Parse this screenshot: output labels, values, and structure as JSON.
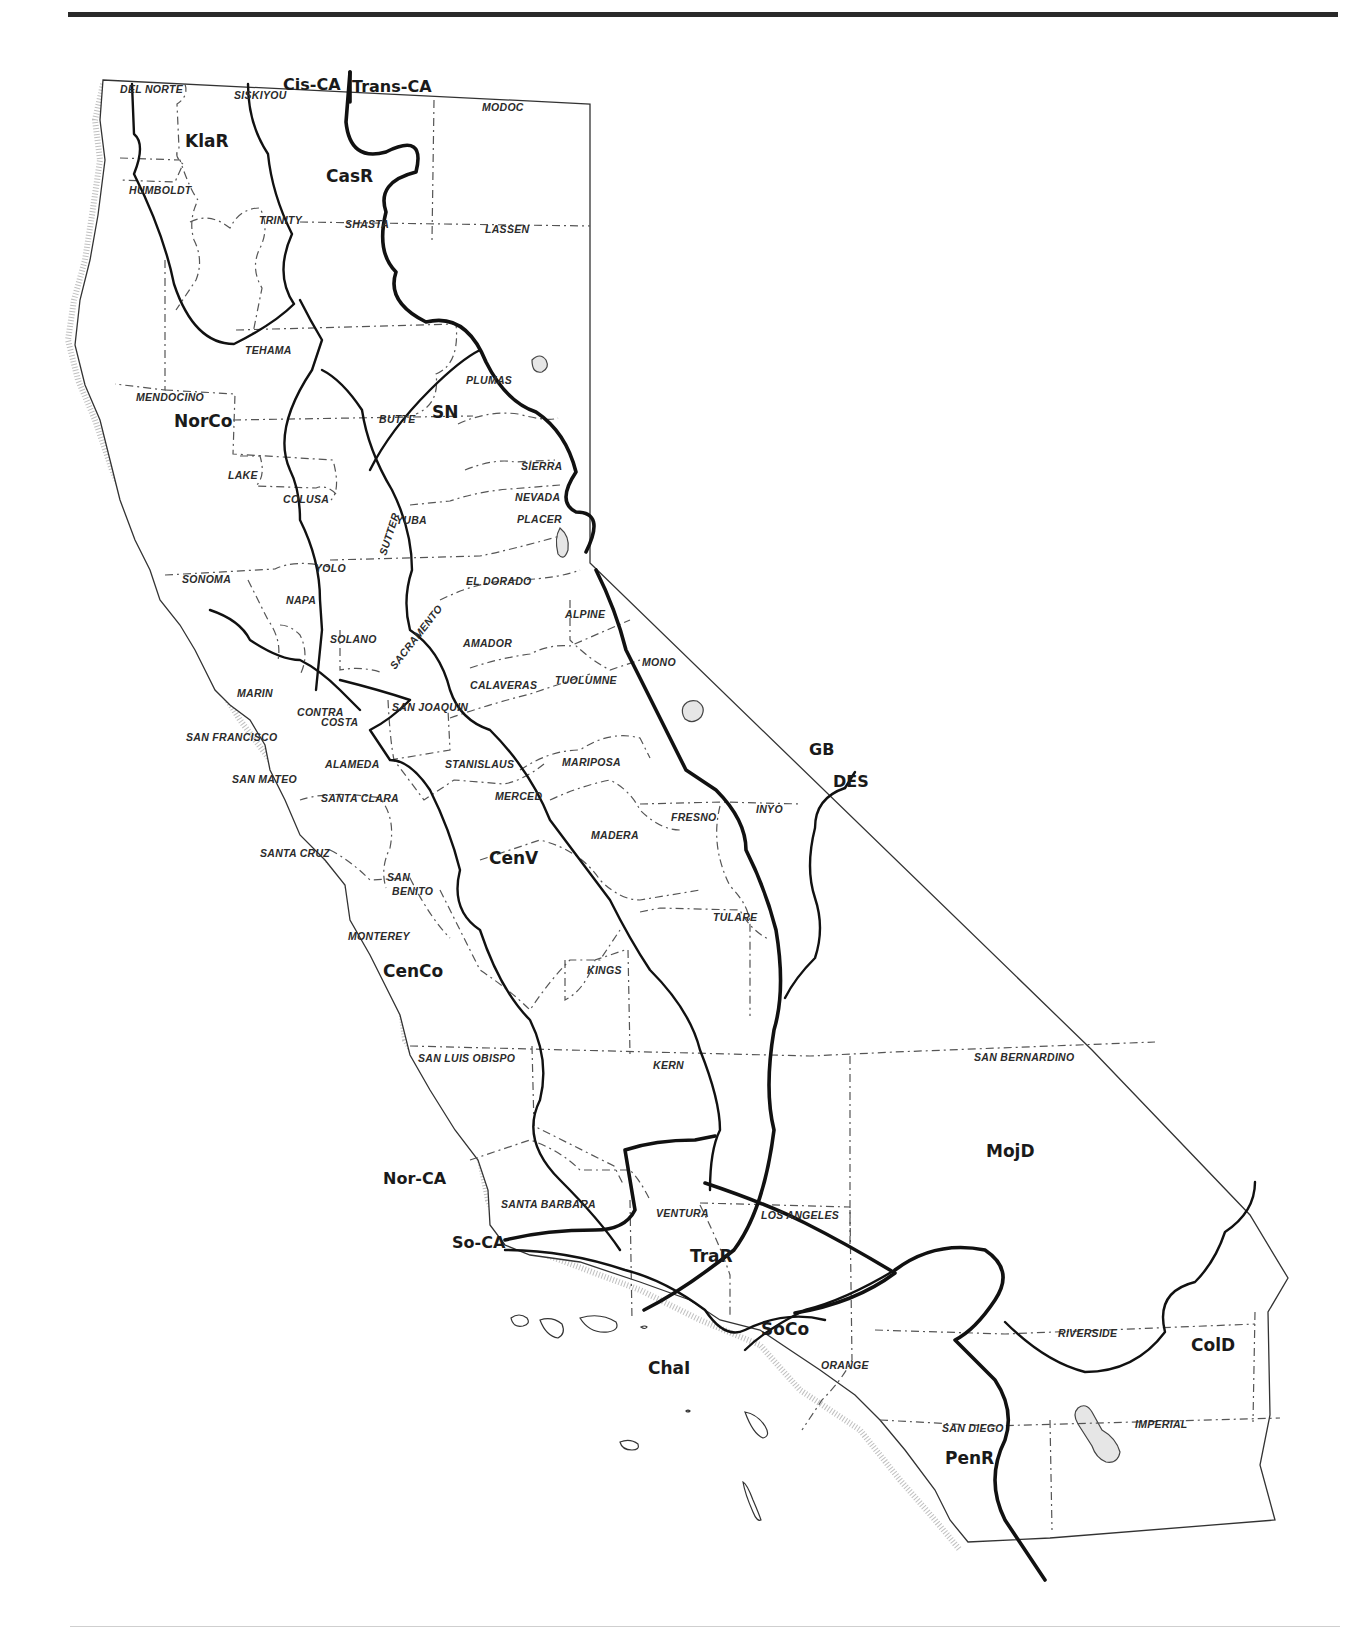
{
  "map": {
    "title": "California floristic provinces, regions and counties",
    "colors": {
      "ink": "#111111",
      "county_line": "#555555",
      "paper": "#ffffff",
      "rule": "#2a2a2a"
    },
    "divisions": [
      {
        "id": "cis-ca",
        "label": "Cis-CA",
        "x": 283,
        "y": 90
      },
      {
        "id": "trans-ca",
        "label": "Trans-CA",
        "x": 352,
        "y": 92
      },
      {
        "id": "gb",
        "label": "GB",
        "x": 809,
        "y": 755
      },
      {
        "id": "des",
        "label": "DES",
        "x": 833,
        "y": 787
      },
      {
        "id": "nor-ca",
        "label": "Nor-CA",
        "x": 383,
        "y": 1184
      },
      {
        "id": "so-ca",
        "label": "So-CA",
        "x": 452,
        "y": 1248
      }
    ],
    "regions": [
      {
        "id": "klar",
        "label": "KlaR",
        "x": 185,
        "y": 147
      },
      {
        "id": "casr",
        "label": "CasR",
        "x": 326,
        "y": 182
      },
      {
        "id": "norco",
        "label": "NorCo",
        "x": 174,
        "y": 427
      },
      {
        "id": "sn",
        "label": "SN",
        "x": 432,
        "y": 418
      },
      {
        "id": "cenv",
        "label": "CenV",
        "x": 489,
        "y": 864
      },
      {
        "id": "cenco",
        "label": "CenCo",
        "x": 383,
        "y": 977
      },
      {
        "id": "mojd",
        "label": "MojD",
        "x": 986,
        "y": 1157
      },
      {
        "id": "trar",
        "label": "TraR",
        "x": 690,
        "y": 1262
      },
      {
        "id": "soco",
        "label": "SoCo",
        "x": 761,
        "y": 1335
      },
      {
        "id": "chai",
        "label": "ChaI",
        "x": 648,
        "y": 1374
      },
      {
        "id": "cold",
        "label": "ColD",
        "x": 1191,
        "y": 1351
      },
      {
        "id": "penr",
        "label": "PenR",
        "x": 945,
        "y": 1464
      }
    ],
    "counties": [
      {
        "label": "DEL NORTE",
        "x": 120,
        "y": 93
      },
      {
        "label": "SISKIYOU",
        "x": 234,
        "y": 99
      },
      {
        "label": "MODOC",
        "x": 482,
        "y": 111
      },
      {
        "label": "HUMBOLDT",
        "x": 129,
        "y": 194
      },
      {
        "label": "TRINITY",
        "x": 259,
        "y": 224
      },
      {
        "label": "SHASTA",
        "x": 345,
        "y": 228
      },
      {
        "label": "LASSEN",
        "x": 485,
        "y": 233
      },
      {
        "label": "TEHAMA",
        "x": 245,
        "y": 354
      },
      {
        "label": "MENDOCINO",
        "x": 136,
        "y": 401
      },
      {
        "label": "PLUMAS",
        "x": 466,
        "y": 384
      },
      {
        "label": "BUTTE",
        "x": 379,
        "y": 423
      },
      {
        "label": "LAKE",
        "x": 228,
        "y": 479
      },
      {
        "label": "SIERRA",
        "x": 521,
        "y": 470
      },
      {
        "label": "COLUSA",
        "x": 283,
        "y": 503
      },
      {
        "label": "NEVADA",
        "x": 515,
        "y": 501
      },
      {
        "label": "YUBA",
        "x": 396,
        "y": 524
      },
      {
        "label": "PLACER",
        "x": 517,
        "y": 523
      },
      {
        "label": "SUTTER",
        "x": 386,
        "y": 556,
        "rotate": -72
      },
      {
        "label": "YOLO",
        "x": 315,
        "y": 572
      },
      {
        "label": "SONOMA",
        "x": 182,
        "y": 583
      },
      {
        "label": "EL DORADO",
        "x": 466,
        "y": 585
      },
      {
        "label": "NAPA",
        "x": 286,
        "y": 604
      },
      {
        "label": "ALPINE",
        "x": 565,
        "y": 618
      },
      {
        "label": "SACRAMENTO",
        "x": 395,
        "y": 670,
        "rotate": -52
      },
      {
        "label": "SOLANO",
        "x": 330,
        "y": 643
      },
      {
        "label": "AMADOR",
        "x": 463,
        "y": 647
      },
      {
        "label": "MONO",
        "x": 642,
        "y": 666
      },
      {
        "label": "MARIN",
        "x": 237,
        "y": 697
      },
      {
        "label": "CALAVERAS",
        "x": 470,
        "y": 689
      },
      {
        "label": "TUOLUMNE",
        "x": 555,
        "y": 684
      },
      {
        "label": "CONTRA",
        "x": 297,
        "y": 716
      },
      {
        "label": "SAN JOAQUIN",
        "x": 392,
        "y": 711
      },
      {
        "label": "COSTA",
        "x": 321,
        "y": 726
      },
      {
        "label": "SAN FRANCISCO",
        "x": 186,
        "y": 741
      },
      {
        "label": "ALAMEDA",
        "x": 325,
        "y": 768
      },
      {
        "label": "STANISLAUS",
        "x": 445,
        "y": 768
      },
      {
        "label": "MARIPOSA",
        "x": 562,
        "y": 766
      },
      {
        "label": "SAN MATEO",
        "x": 232,
        "y": 783
      },
      {
        "label": "SANTA CLARA",
        "x": 321,
        "y": 802
      },
      {
        "label": "MERCED",
        "x": 495,
        "y": 800
      },
      {
        "label": "INYO",
        "x": 756,
        "y": 813
      },
      {
        "label": "MADERA",
        "x": 591,
        "y": 839
      },
      {
        "label": "FRESNO",
        "x": 671,
        "y": 821
      },
      {
        "label": "SANTA CRUZ",
        "x": 260,
        "y": 857
      },
      {
        "label": "SAN",
        "x": 387,
        "y": 881
      },
      {
        "label": "BENITO",
        "x": 392,
        "y": 895
      },
      {
        "label": "TULARE",
        "x": 713,
        "y": 921
      },
      {
        "label": "MONTEREY",
        "x": 348,
        "y": 940
      },
      {
        "label": "KINGS",
        "x": 587,
        "y": 974
      },
      {
        "label": "SAN BERNARDINO",
        "x": 974,
        "y": 1061
      },
      {
        "label": "SAN LUIS OBISPO",
        "x": 418,
        "y": 1062
      },
      {
        "label": "KERN",
        "x": 653,
        "y": 1069
      },
      {
        "label": "SANTA BARBARA",
        "x": 501,
        "y": 1208
      },
      {
        "label": "VENTURA",
        "x": 656,
        "y": 1217
      },
      {
        "label": "LOS ANGELES",
        "x": 761,
        "y": 1219
      },
      {
        "label": "RIVERSIDE",
        "x": 1058,
        "y": 1337
      },
      {
        "label": "ORANGE",
        "x": 821,
        "y": 1369
      },
      {
        "label": "SAN DIEGO",
        "x": 942,
        "y": 1432
      },
      {
        "label": "IMPERIAL",
        "x": 1135,
        "y": 1428
      }
    ]
  },
  "page": {
    "top_rule": true,
    "bottom_rule": true
  }
}
